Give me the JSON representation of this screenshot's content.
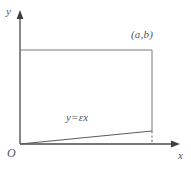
{
  "figure": {
    "axes": {
      "y_axis_label": "y",
      "x_axis_label": "x",
      "origin_label": "O"
    },
    "annotations": {
      "corner_point": "(a,b)",
      "line_equation": "y=εx"
    },
    "style": {
      "stroke_color": "#7a7a7a",
      "axis_color": "#4a4a4a",
      "text_color": "#555555",
      "background_color": "#ffffff",
      "stroke_width": 1
    },
    "geometry": {
      "origin": [
        20,
        144
      ],
      "y_axis_top": [
        20,
        12
      ],
      "x_axis_right": [
        179,
        144
      ],
      "rect_top_left": [
        20,
        50
      ],
      "rect_top_right": [
        152,
        50
      ],
      "rect_bottom_right": [
        152,
        131
      ],
      "rect_bottom_left": [
        20,
        144
      ],
      "slope_line_start": [
        20,
        144
      ],
      "slope_line_end": [
        152,
        131
      ],
      "dashed_segment": [
        [
          152,
          131
        ],
        [
          152,
          144
        ]
      ]
    }
  }
}
